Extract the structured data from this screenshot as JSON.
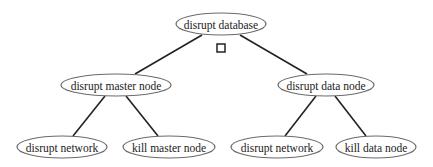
{
  "diagram": {
    "type": "tree",
    "colors": {
      "edge": "#222222",
      "node_stroke": "#6b6b6b",
      "background": "#ffffff"
    },
    "nodes": [
      {
        "id": "root",
        "label": "disrupt database",
        "cx": 221,
        "cy": 24,
        "rx": 45,
        "ry": 11
      },
      {
        "id": "master",
        "label": "disrupt master node",
        "cx": 116,
        "cy": 85,
        "rx": 55,
        "ry": 11
      },
      {
        "id": "data",
        "label": "disrupt data node",
        "cx": 326,
        "cy": 85,
        "rx": 48,
        "ry": 11
      },
      {
        "id": "master_net",
        "label": "disrupt network",
        "cx": 62,
        "cy": 147,
        "rx": 45,
        "ry": 11
      },
      {
        "id": "master_kill",
        "label": "kill master node",
        "cx": 169,
        "cy": 147,
        "rx": 46,
        "ry": 11
      },
      {
        "id": "data_net",
        "label": "disrupt network",
        "cx": 277,
        "cy": 147,
        "rx": 46,
        "ry": 11
      },
      {
        "id": "data_kill",
        "label": "kill data node",
        "cx": 376,
        "cy": 147,
        "rx": 40,
        "ry": 11
      }
    ],
    "edges": [
      {
        "from": "root",
        "to": "master",
        "x1": 202,
        "y1": 35,
        "x2": 135,
        "y2": 74
      },
      {
        "from": "root",
        "to": "data",
        "x1": 240,
        "y1": 35,
        "x2": 307,
        "y2": 74
      },
      {
        "from": "master",
        "to": "master_net",
        "x1": 105,
        "y1": 96,
        "x2": 73,
        "y2": 136
      },
      {
        "from": "master",
        "to": "master_kill",
        "x1": 126,
        "y1": 96,
        "x2": 158,
        "y2": 136
      },
      {
        "from": "data",
        "to": "data_net",
        "x1": 316,
        "y1": 96,
        "x2": 285,
        "y2": 136
      },
      {
        "from": "data",
        "to": "data_kill",
        "x1": 335,
        "y1": 96,
        "x2": 366,
        "y2": 136
      }
    ],
    "gate_marker": {
      "shape": "square",
      "x": 217,
      "y": 44,
      "size": 8
    }
  }
}
